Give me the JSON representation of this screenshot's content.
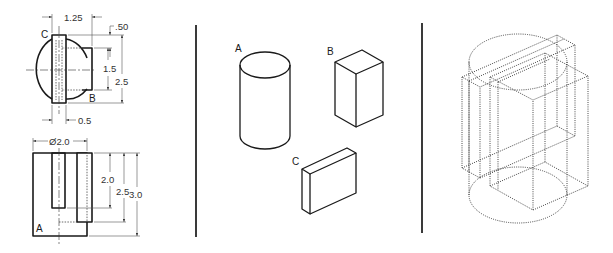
{
  "figure": {
    "panel_left": {
      "title": "Orthographic views with dimensions",
      "top_view": {
        "labels": {
          "part_c": "C",
          "part_b": "B"
        },
        "dimensions": {
          "width_offset": "1.25",
          "top_offset": ".50",
          "b_height": "1.5",
          "overall_depth": "2.5",
          "slot_width": "0.5"
        }
      },
      "front_view": {
        "labels": {
          "part_a": "A"
        },
        "dimensions": {
          "diameter": "Ø2.0",
          "slot_depth": "2.0",
          "b_height": "2.5",
          "overall_height": "3.0"
        }
      }
    },
    "panel_middle": {
      "title": "Isometric component parts",
      "parts": [
        {
          "label": "A",
          "shape": "cylinder"
        },
        {
          "label": "B",
          "shape": "rectangular prism"
        },
        {
          "label": "C",
          "shape": "thin plate"
        }
      ]
    },
    "panel_right": {
      "title": "Assembled isometric (hidden lines)"
    }
  }
}
